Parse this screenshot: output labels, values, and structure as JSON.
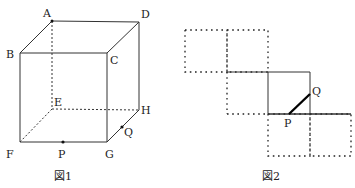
{
  "figure1": {
    "caption": "図1",
    "vertices": {
      "A": "A",
      "B": "B",
      "C": "C",
      "D": "D",
      "E": "E",
      "F": "F",
      "G": "G",
      "H": "H"
    },
    "points": {
      "P": "P",
      "Q": "Q"
    }
  },
  "figure2": {
    "caption": "図2",
    "points": {
      "P": "P",
      "Q": "Q"
    }
  }
}
